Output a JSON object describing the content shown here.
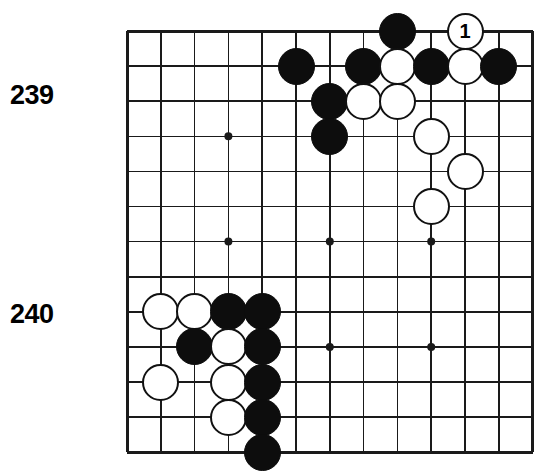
{
  "diagram": {
    "kind": "go-board-diagram",
    "board": {
      "columns": 13,
      "rows": 13,
      "grid_spacing_px": 33.8,
      "origin_x_px": 127,
      "origin_y_px": 31,
      "row_spacing_px": 35.1,
      "line_color": "#1a1a1a",
      "border_color": "#000000",
      "background_color": "#ffffff",
      "star_points": [
        {
          "col": 3,
          "row": 3
        },
        {
          "col": 3,
          "row": 6
        },
        {
          "col": 6,
          "row": 6
        },
        {
          "col": 9,
          "row": 6
        },
        {
          "col": 6,
          "row": 9
        },
        {
          "col": 9,
          "row": 9
        }
      ]
    },
    "labels": [
      {
        "text": "239",
        "x_px": 10,
        "y_px": 82
      },
      {
        "text": "240",
        "x_px": 10,
        "y_px": 301
      }
    ],
    "stones": [
      {
        "color": "black",
        "col": 8,
        "row": 0,
        "label": ""
      },
      {
        "color": "white",
        "col": 10,
        "row": 0,
        "label": "1"
      },
      {
        "color": "black",
        "col": 5,
        "row": 1,
        "label": ""
      },
      {
        "color": "black",
        "col": 7,
        "row": 1,
        "label": ""
      },
      {
        "color": "white",
        "col": 8,
        "row": 1,
        "label": ""
      },
      {
        "color": "black",
        "col": 9,
        "row": 1,
        "label": ""
      },
      {
        "color": "white",
        "col": 10,
        "row": 1,
        "label": ""
      },
      {
        "color": "black",
        "col": 11,
        "row": 1,
        "label": ""
      },
      {
        "color": "black",
        "col": 6,
        "row": 2,
        "label": ""
      },
      {
        "color": "white",
        "col": 7,
        "row": 2,
        "label": ""
      },
      {
        "color": "white",
        "col": 8,
        "row": 2,
        "label": ""
      },
      {
        "color": "black",
        "col": 6,
        "row": 3,
        "label": ""
      },
      {
        "color": "white",
        "col": 9,
        "row": 3,
        "label": ""
      },
      {
        "color": "white",
        "col": 10,
        "row": 4,
        "label": ""
      },
      {
        "color": "white",
        "col": 9,
        "row": 5,
        "label": ""
      },
      {
        "color": "white",
        "col": 1,
        "row": 8,
        "label": ""
      },
      {
        "color": "white",
        "col": 2,
        "row": 8,
        "label": ""
      },
      {
        "color": "black",
        "col": 3,
        "row": 8,
        "label": ""
      },
      {
        "color": "black",
        "col": 4,
        "row": 8,
        "label": ""
      },
      {
        "color": "black",
        "col": 2,
        "row": 9,
        "label": ""
      },
      {
        "color": "white",
        "col": 3,
        "row": 9,
        "label": ""
      },
      {
        "color": "black",
        "col": 4,
        "row": 9,
        "label": ""
      },
      {
        "color": "white",
        "col": 1,
        "row": 10,
        "label": ""
      },
      {
        "color": "white",
        "col": 3,
        "row": 10,
        "label": ""
      },
      {
        "color": "black",
        "col": 4,
        "row": 10,
        "label": ""
      },
      {
        "color": "white",
        "col": 3,
        "row": 11,
        "label": ""
      },
      {
        "color": "black",
        "col": 4,
        "row": 11,
        "label": ""
      },
      {
        "color": "black",
        "col": 4,
        "row": 12,
        "label": ""
      }
    ],
    "stone_diameter_px": 37
  }
}
